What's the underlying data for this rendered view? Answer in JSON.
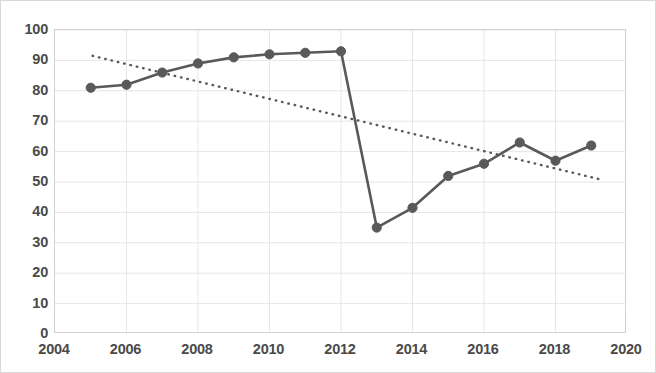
{
  "chart_data": {
    "type": "line",
    "title": "",
    "subtitle": "",
    "xlabel": "",
    "ylabel": "",
    "xlim": [
      2004,
      2020
    ],
    "ylim": [
      0,
      100
    ],
    "grid": true,
    "legend_position": "none",
    "x_ticks": [
      2004,
      2006,
      2008,
      2010,
      2012,
      2014,
      2016,
      2018,
      2020
    ],
    "x_tick_labels": [
      "2004",
      "2006",
      "2008",
      "2010",
      "2012",
      "2014",
      "2016",
      "2018",
      "2020"
    ],
    "y_ticks": [
      0,
      10,
      20,
      30,
      40,
      50,
      60,
      70,
      80,
      90,
      100
    ],
    "y_tick_labels": [
      "0",
      "10",
      "20",
      "30",
      "40",
      "50",
      "60",
      "70",
      "80",
      "90",
      "100"
    ],
    "x": [
      2005,
      2006,
      2007,
      2008,
      2009,
      2010,
      2011,
      2012,
      2013,
      2014,
      2015,
      2016,
      2017,
      2018,
      2019
    ],
    "series": [
      {
        "name": "data-series",
        "style": "solid-line-with-markers",
        "color": "#595959",
        "values": [
          81,
          82,
          86,
          89,
          91,
          92,
          92.5,
          93,
          35,
          41.5,
          52,
          56,
          63,
          57,
          62
        ]
      },
      {
        "name": "trendline",
        "style": "dotted-line",
        "color": "#595959",
        "x": [
          2005.05,
          2019.2
        ],
        "values": [
          91.5,
          51
        ]
      }
    ],
    "annotations": []
  }
}
